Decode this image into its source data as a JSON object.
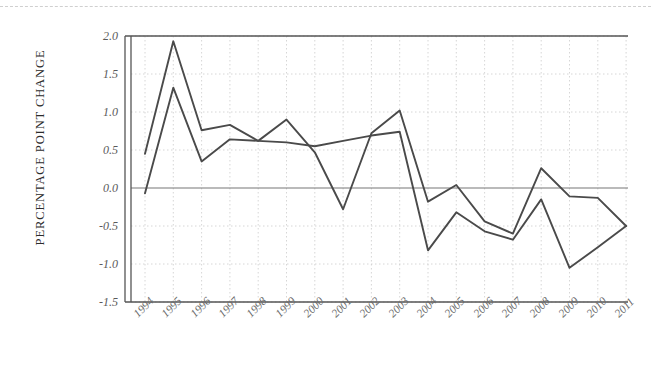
{
  "figure": {
    "background_color": "#ffffff",
    "top_rule": "page-edge-dashed-rule"
  },
  "chart_data": {
    "type": "line",
    "title": "",
    "xlabel": "",
    "ylabel": "PERCENTAGE POINT CHANGE",
    "x": [
      1994,
      1995,
      1996,
      1997,
      1998,
      1999,
      2000,
      2001,
      2002,
      2003,
      2004,
      2005,
      2006,
      2007,
      2008,
      2009,
      2010,
      2011
    ],
    "categories": [
      "1994",
      "1995",
      "1996",
      "1997",
      "1998",
      "1999",
      "2000",
      "2001",
      "2002",
      "2003",
      "2004",
      "2005",
      "2006",
      "2007",
      "2008",
      "2009",
      "2010",
      "2011"
    ],
    "series": [
      {
        "name": "series-1",
        "color": "#4a4a4a",
        "values": [
          0.45,
          1.93,
          0.76,
          0.83,
          0.62,
          0.9,
          0.47,
          -0.28,
          0.72,
          1.02,
          -0.18,
          0.04,
          -0.44,
          -0.6,
          0.26,
          -0.11,
          -0.13,
          -0.5
        ]
      },
      {
        "name": "series-2",
        "color": "#4a4a4a",
        "values": [
          -0.07,
          1.32,
          0.35,
          0.64,
          0.62,
          0.6,
          0.55,
          0.62,
          0.69,
          0.74,
          -0.82,
          -0.32,
          -0.57,
          -0.68,
          -0.15,
          -1.05,
          -0.78,
          -0.5
        ]
      }
    ],
    "ylim": [
      -1.5,
      2.0
    ],
    "yticks": [
      2.0,
      1.5,
      1.0,
      0.5,
      0.0,
      -0.5,
      -1.0,
      -1.5
    ],
    "ytick_labels": [
      "2.0",
      "1.5",
      "1.0",
      "0.5",
      "0.0",
      "-0.5",
      "-1.0",
      "-1.5"
    ],
    "xtick_labels": [
      "1994",
      "1995",
      "1996",
      "1997",
      "1998",
      "1999",
      "2000",
      "2001",
      "2002",
      "2003",
      "2004",
      "2005",
      "2006",
      "2007",
      "2008",
      "2009",
      "2010",
      "2011"
    ],
    "xtick_rotation_deg": -45,
    "grid": {
      "x_grid": true,
      "y_grid": true,
      "style": "dotted",
      "color": "#cccccc"
    },
    "zero_line": {
      "value": 0.0,
      "visible": true,
      "color": "#777777"
    },
    "legend": {
      "visible": false,
      "position": "none"
    },
    "axis_frame": {
      "double_left_spine": true,
      "top_spine": true,
      "bottom_spine": true,
      "color": "#555555"
    }
  }
}
